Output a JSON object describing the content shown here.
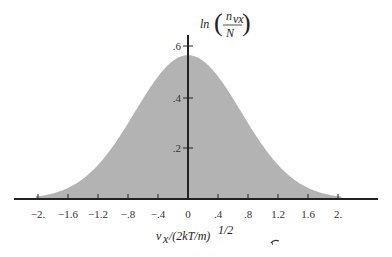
{
  "chart_data": {
    "type": "area",
    "title": "",
    "xlabel": "v_x/(2kT/m)^{1/2}",
    "ylabel": "ln(n_vx/N)",
    "xlim": [
      -2.4,
      2.4
    ],
    "ylim": [
      0,
      0.6
    ],
    "x_ticks": [
      -2.0,
      -1.6,
      -1.2,
      -0.8,
      -0.4,
      0,
      0.4,
      0.8,
      1.2,
      1.6,
      2.0
    ],
    "x_tick_labels": [
      "−2.",
      "−1.6",
      "−1.2",
      "−.8",
      "−.4",
      "0",
      ".4",
      ".8",
      "1.2",
      "1.6",
      "2."
    ],
    "y_ticks": [
      0.2,
      0.4,
      0.6
    ],
    "y_tick_labels": [
      ".2",
      ".4",
      ".6"
    ],
    "grid": false,
    "legend": null,
    "series": [
      {
        "name": "Maxwell velocity distribution (one component)",
        "x": [
          -2.0,
          -1.6,
          -1.2,
          -0.8,
          -0.4,
          0,
          0.4,
          0.8,
          1.2,
          1.6,
          2.0
        ],
        "values": [
          0.01,
          0.04,
          0.13,
          0.3,
          0.48,
          0.564,
          0.48,
          0.3,
          0.13,
          0.04,
          0.01
        ]
      }
    ],
    "fill_color": "#b3b3b3"
  },
  "labels": {
    "y_axis_title_prefix": "ln",
    "y_axis_title_num": "n",
    "y_axis_title_num_sub": "vx",
    "y_axis_title_den": "N",
    "x_axis_title": "v",
    "x_axis_title_sub": "x",
    "x_axis_title_rest": "/(2kT/m)",
    "x_axis_title_sup": "1/2"
  }
}
